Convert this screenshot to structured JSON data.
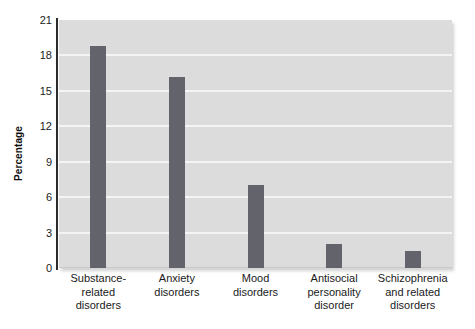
{
  "chart_data": {
    "type": "bar",
    "title": "",
    "xlabel": "",
    "ylabel": "Percentage",
    "ylim": [
      0,
      21
    ],
    "yticks": [
      0,
      3,
      6,
      9,
      12,
      15,
      18,
      21
    ],
    "grid": true,
    "legend": "none",
    "categories": [
      "Substance-related disorders",
      "Anxiety disorders",
      "Mood disorders",
      "Antisocial personality disorder",
      "Schizophrenia and related disorders"
    ],
    "category_lines": [
      [
        "Substance-",
        "related",
        "disorders"
      ],
      [
        "Anxiety",
        "disorders"
      ],
      [
        "Mood",
        "disorders"
      ],
      [
        "Antisocial",
        "personality",
        "disorder"
      ],
      [
        "Schizophrenia",
        "and related",
        "disorders"
      ]
    ],
    "values": [
      18.8,
      16.2,
      7.0,
      2.0,
      1.4
    ],
    "colors": {
      "bar": "#63636b",
      "plot_background": "#dcdcdc",
      "gridline": "#f4f4f4",
      "axis": "#2b2b2b",
      "text": "#1a1a1a",
      "page_background": "#ffffff"
    }
  }
}
